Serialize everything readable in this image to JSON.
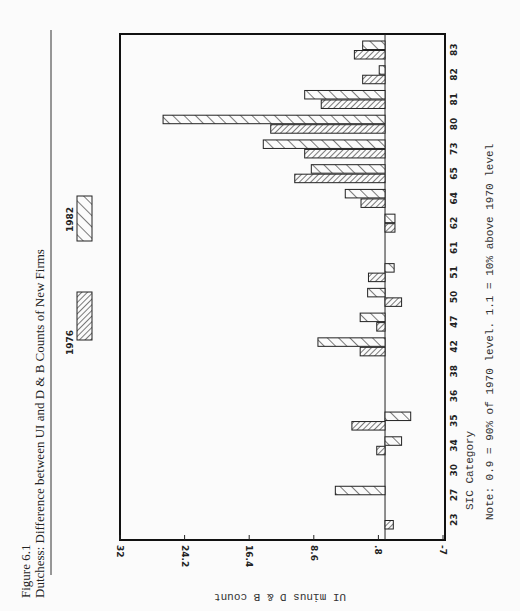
{
  "figure": {
    "number": "Figure 6.1",
    "caption": "Dutchess: Difference between UI and D & B Counts of New Firms"
  },
  "chart_data": {
    "type": "bar",
    "orientation": "horizontal-rotated-page",
    "title": "Dutchess: Difference between UI and D & B Counts of New Firms",
    "xlabel": "SIC Category",
    "ylabel": "UI minus D & B count",
    "ylim": [
      -7,
      32
    ],
    "yticks": [
      "32",
      "24.2",
      "16.4",
      "8.6",
      ".8",
      "-7"
    ],
    "ytick_values": [
      32,
      24.2,
      16.4,
      8.6,
      0.8,
      -7
    ],
    "categories": [
      "23",
      "27",
      "30",
      "34",
      "35",
      "36",
      "38",
      "42",
      "47",
      "50",
      "51",
      "61",
      "62",
      "64",
      "65",
      "73",
      "80",
      "81",
      "82",
      "83"
    ],
    "series": [
      {
        "name": "1976",
        "pattern": "dense-hatch",
        "values": [
          -1.0,
          0,
          0,
          1.0,
          4.0,
          0,
          0,
          3.0,
          1.0,
          -2.0,
          2.0,
          0,
          -1.2,
          2.9,
          10.9,
          9.7,
          13.8,
          7.7,
          2.7,
          3.7
        ]
      },
      {
        "name": "1982",
        "pattern": "sparse-hatch",
        "values": [
          0,
          6.0,
          0,
          -2.0,
          -3.1,
          0,
          0,
          8.1,
          3.0,
          2.1,
          -1.1,
          0,
          -1.2,
          4.8,
          8.9,
          14.7,
          26.8,
          9.7,
          0.7,
          2.7
        ]
      }
    ],
    "legend": [
      "1976",
      "1982"
    ],
    "legend_placement": "top",
    "grid": false,
    "note": "Note:  0.9 = 90% of 1970 level.  1.1 = 10% above 1970 level"
  }
}
